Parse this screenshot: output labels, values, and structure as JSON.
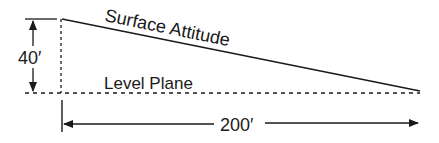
{
  "diagram": {
    "labels": {
      "surface": "Surface Attitude",
      "level": "Level Plane",
      "height": "40′",
      "length": "200′"
    },
    "colors": {
      "line": "#1a1a1a",
      "background": "#ffffff"
    }
  }
}
